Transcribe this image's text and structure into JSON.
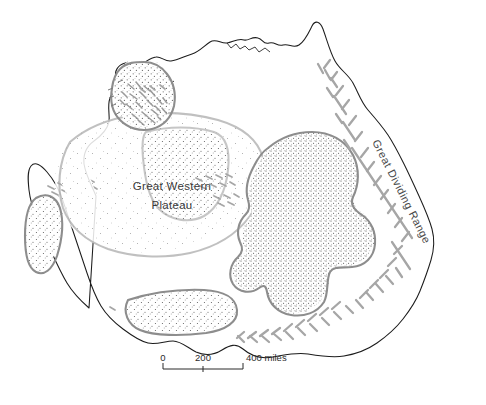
{
  "map": {
    "title": "Physiographic map of Australia",
    "subject": "Australia",
    "background_color": "#ffffff",
    "coast_color": "#1c1c1c",
    "region_outline_color": "#8d8d8d",
    "stipple_color": "#4a4a4a",
    "hill_shading_color": "#a0a0a0",
    "labels": [
      {
        "id": "great-western-plateau",
        "line1": "Great Western",
        "line2": "Plateau"
      },
      {
        "id": "great-dividing-range",
        "text": "Great  Dividing  Range"
      }
    ],
    "scale_bar": {
      "start_label": "0",
      "mid_label": "200",
      "end_label": "400 miles",
      "units": "miles",
      "ticks": [
        0,
        200,
        400
      ]
    },
    "regions": [
      {
        "id": "kimberley-plateau",
        "style": "outlined-stippled-hills"
      },
      {
        "id": "great-western-plateau",
        "style": "light-stipple"
      },
      {
        "id": "central-lowlands-basin",
        "style": "outlined-dense-stipple"
      },
      {
        "id": "western-coastal-basin",
        "style": "outlined-stipple"
      },
      {
        "id": "nullarbor-basin",
        "style": "outlined-stipple"
      },
      {
        "id": "murray-basin",
        "style": "outlined-stipple"
      },
      {
        "id": "eastern-highlands",
        "style": "hill-shading"
      }
    ]
  }
}
